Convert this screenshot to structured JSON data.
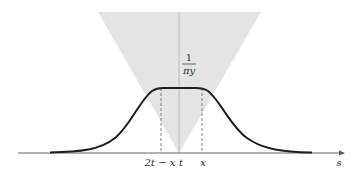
{
  "figure": {
    "colors": {
      "background": "#ffffff",
      "cone_fill": "#e4e4e4",
      "curve": "#1f1f1f",
      "axis": "#555555",
      "dashed": "#666666",
      "center_line": "#aaaaaa"
    },
    "labels": {
      "plateau_numerator": "1",
      "plateau_denominator": "πy",
      "axis_s": "s",
      "tick_left": "2t − x",
      "tick_center": "t",
      "tick_right": "x"
    }
  }
}
